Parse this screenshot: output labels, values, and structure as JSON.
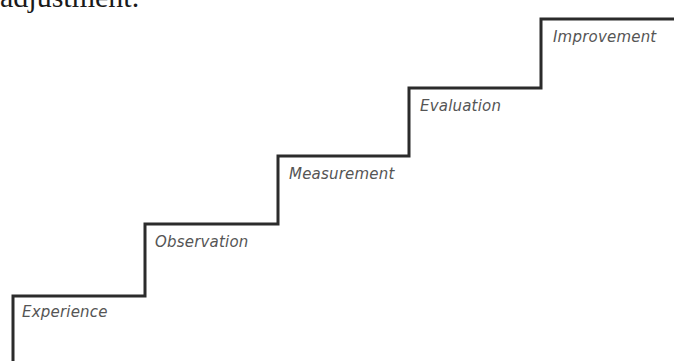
{
  "top_text": "adjustment.",
  "colors": {
    "line": "#2b2b2b",
    "label": "#555555",
    "background": "#ffffff"
  },
  "steps": [
    {
      "label": "Experience"
    },
    {
      "label": "Observation"
    },
    {
      "label": "Measurement"
    },
    {
      "label": "Evaluation"
    },
    {
      "label": "Improvement"
    }
  ]
}
